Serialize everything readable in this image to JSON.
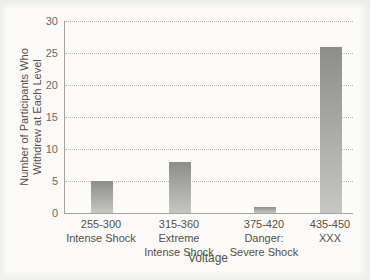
{
  "figure": {
    "background": "#fcfbf9",
    "axis_color": "#a3a39d",
    "grid_color": "#b8b8b2",
    "tick_text_color": "#6f695f",
    "label_text_color": "#554f47",
    "bar_gradient_top": "#8d8d89",
    "bar_gradient_bottom": "#c6c6c2"
  },
  "chart_data": {
    "type": "bar",
    "title": "",
    "xlabel": "Voltage",
    "ylabel": "Number of Participants Who Withdrew at Each Level",
    "ylabel_lines": [
      "Number of Participants Who",
      "Withdrew at Each Level"
    ],
    "categories": [
      "255-300",
      "315-360",
      "375-420",
      "435-450"
    ],
    "category_sublabels": [
      [
        "Intense Shock"
      ],
      [
        "Extreme",
        "Intense Shock"
      ],
      [
        "Danger:",
        "Severe Shock"
      ],
      [
        "XXX"
      ]
    ],
    "values": [
      5,
      8,
      1,
      26
    ],
    "ylim": [
      0,
      30
    ],
    "yticks": [
      0,
      5,
      10,
      15,
      20,
      25,
      30
    ],
    "grid": "horizontal-dotted",
    "legend": "none"
  }
}
